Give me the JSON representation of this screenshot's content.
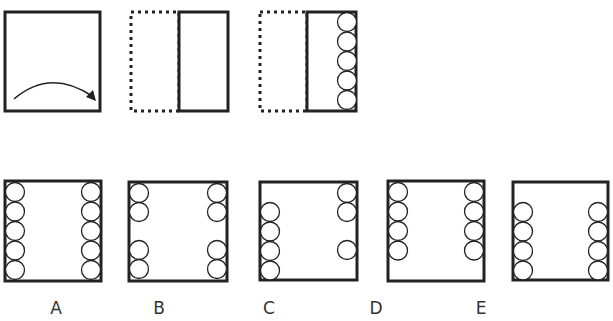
{
  "question": {
    "steps": [
      {
        "id": "step-1",
        "description": "square sheet with curved arrow indicating folding from left to right",
        "icon": "curved-arrow-icon"
      },
      {
        "id": "step-2",
        "description": "sheet folded in half, left half shown dotted"
      },
      {
        "id": "step-3",
        "description": "folded sheet with 5 circles punched along the right edge",
        "circle_count": 5
      }
    ]
  },
  "options": [
    {
      "label": "A",
      "left_circles": [
        0,
        1,
        2,
        3,
        4
      ],
      "right_circles": [
        0,
        1,
        2,
        3,
        4
      ]
    },
    {
      "label": "B",
      "left_circles": [
        0,
        1,
        3,
        4
      ],
      "right_circles": [
        0,
        1,
        3,
        4
      ]
    },
    {
      "label": "C",
      "left_circles": [
        1,
        2,
        3,
        4
      ],
      "right_circles": [
        0,
        1,
        3
      ]
    },
    {
      "label": "D",
      "left_circles": [
        0,
        1,
        2,
        3
      ],
      "right_circles": [
        0,
        1,
        2,
        3
      ]
    },
    {
      "label": "E",
      "left_circles": [
        1,
        2,
        3,
        4
      ],
      "right_circles": [
        1,
        2,
        3,
        4
      ]
    }
  ],
  "colors": {
    "stroke": "#222222",
    "background": "#ffffff",
    "label": "#333333"
  }
}
